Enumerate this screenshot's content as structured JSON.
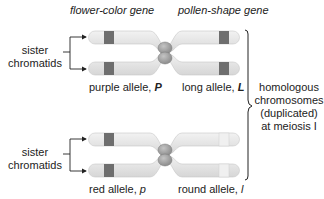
{
  "header": {
    "gene_left": "flower-color gene",
    "gene_right": "pollen-shape gene"
  },
  "top_pair": {
    "sister_label_1": "sister",
    "sister_label_2": "chromatids",
    "allele_left_text": "purple allele, ",
    "allele_left_symbol": "P",
    "allele_right_text": "long allele, ",
    "allele_right_symbol": "L"
  },
  "bottom_pair": {
    "sister_label_1": "sister",
    "sister_label_2": "chromatids",
    "allele_left_text": "red allele, ",
    "allele_left_symbol": "p",
    "allele_right_text": "round allele, ",
    "allele_right_symbol": "l"
  },
  "bracket_label": {
    "line1": "homologous",
    "line2": "chromosomes",
    "line3": "(duplicated)",
    "line4": "at meiosis I"
  },
  "colors": {
    "chromatid_fill": "#e6e6e6",
    "chromatid_stroke": "#c8c8c8",
    "dark_band": "#6e6e6e",
    "light_band": "#d8d8d8",
    "centromere": "#9a9a9a",
    "line": "#222222"
  }
}
